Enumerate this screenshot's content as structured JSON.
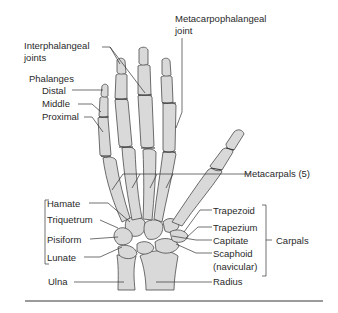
{
  "diagram": {
    "colors": {
      "bone_fill": "#d9d9d9",
      "bone_stroke": "#4a4a4a",
      "text": "#2a2a2a",
      "rule": "#9a9a9a"
    },
    "labels": {
      "interphalangeal_joints": "Interphalangeal\njoints",
      "interphalangeal_l1": "Interphalangeal",
      "interphalangeal_l2": "joints",
      "metacarpophalangeal_l1": "Metacarpophalangeal",
      "metacarpophalangeal_l2": "joint",
      "phalanges": "Phalanges",
      "distal": "Distal",
      "middle": "Middle",
      "proximal": "Proximal",
      "metacarpals": "Metacarpals (5)",
      "hamate": "Hamate",
      "triquetrum": "Triquetrum",
      "pisiform": "Pisiform",
      "lunate": "Lunate",
      "trapezoid": "Trapezoid",
      "trapezium": "Trapezium",
      "capitate": "Capitate",
      "scaphoid_l1": "Scaphoid",
      "scaphoid_l2": "(navicular)",
      "carpals": "Carpals",
      "ulna": "Ulna",
      "radius": "Radius"
    }
  }
}
